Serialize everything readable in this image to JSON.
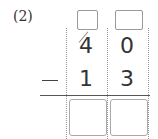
{
  "problem": {
    "label": "(2)",
    "operator": "−",
    "minuend": [
      "4",
      "0"
    ],
    "subtrahend": [
      "1",
      "3"
    ],
    "borrow_boxes": [
      "",
      ""
    ],
    "answer_boxes": [
      "",
      ""
    ],
    "tens_digit_crossed_out": true
  }
}
